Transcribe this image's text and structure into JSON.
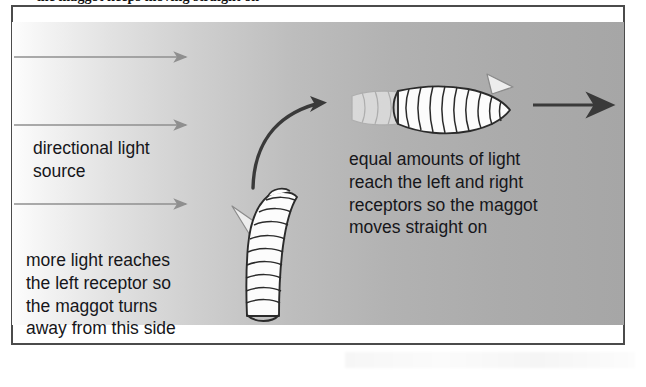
{
  "figure": {
    "caption_top": "the maggot keeps moving straight on",
    "frame": {
      "border_color": "#4b4b4b",
      "background_note": "directional light gradient, bright at left fading to grey at right"
    },
    "colors": {
      "light_ray": "#8f8f8f",
      "dark_arrow": "#3a3a3a",
      "maggot_outline": "#2b2b2b",
      "maggot_fill": "#fbfbfb",
      "text": "#16161a",
      "panel_light": "#fdfdfd",
      "panel_dark": "#a6a6a6"
    },
    "light_rays": [
      {
        "name": "light-ray-top",
        "y": 57,
        "x_start": 14,
        "x_end": 190
      },
      {
        "name": "light-ray-middle",
        "y": 125,
        "x_start": 14,
        "x_end": 190
      },
      {
        "name": "light-ray-bottom",
        "y": 204,
        "x_start": 14,
        "x_end": 190
      }
    ],
    "labels": {
      "light_source": "directional light\nsource",
      "left_turn": "more light reaches\nthe left receptor so\nthe maggot turns\naway from this side",
      "straight_on": "equal amounts of light\nreach the left and right\nreceptors so the maggot\nmoves straight on"
    },
    "maggots": [
      {
        "name": "maggot-turning",
        "orientation": "vertical, curving up and to the right",
        "segment_count": 11,
        "head_position": "top-left, tapered pointed mouthparts"
      },
      {
        "name": "maggot-straight",
        "orientation": "horizontal, body arcing left to right",
        "segment_count": 12,
        "head_position": "right end, tapered pointed mouthparts"
      }
    ],
    "arrows": {
      "curved_turn": {
        "name": "curved-turn-arrow",
        "description": "curved arrow from lower-left sweeping up to upper-right"
      },
      "straight_travel": {
        "name": "straight-travel-arrow",
        "description": "straight black arrow pointing right",
        "y": 105,
        "x_start": 533,
        "x_end": 622
      }
    }
  }
}
